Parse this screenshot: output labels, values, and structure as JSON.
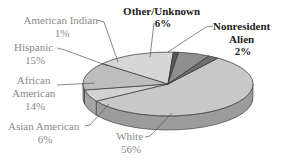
{
  "chart_data": {
    "type": "pie",
    "title": "",
    "style": "3d",
    "slices": [
      {
        "label": "White",
        "value": 56,
        "display": "56%",
        "color": "#c8c8c8",
        "label_color": "#8a8a8a",
        "bold": false
      },
      {
        "label": "Asian American",
        "value": 6,
        "display": "6%",
        "color": "#d2d2d2",
        "label_color": "#8a8a8a",
        "bold": false
      },
      {
        "label": "African American",
        "value": 14,
        "display": "14%",
        "color": "#bdbdbd",
        "label_color": "#8a8a8a",
        "bold": false
      },
      {
        "label": "Hispanic",
        "value": 15,
        "display": "15%",
        "color": "#d6d6d6",
        "label_color": "#8a8a8a",
        "bold": false
      },
      {
        "label": "American Indian",
        "value": 1,
        "display": "1%",
        "color": "#555555",
        "label_color": "#8a8a8a",
        "bold": false
      },
      {
        "label": "Other/Unknown",
        "value": 6,
        "display": "6%",
        "color": "#8f8f8f",
        "label_color": "#222222",
        "bold": true
      },
      {
        "label": "Nonresident Alien",
        "value": 2,
        "display": "2%",
        "color": "#6e6e6e",
        "label_color": "#222222",
        "bold": true
      }
    ],
    "labels_text": {
      "american_indian": [
        "American Indian",
        "1%"
      ],
      "hispanic": [
        "Hispanic",
        "15%"
      ],
      "african_american": [
        "African",
        "American",
        "14%"
      ],
      "asian_american": [
        "Asian American",
        "6%"
      ],
      "white": [
        "White",
        "56%"
      ],
      "other_unknown": [
        "Other/Unknown",
        "6%"
      ],
      "nonresident_alien": [
        "Nonresident",
        "Alien",
        "2%"
      ]
    }
  }
}
